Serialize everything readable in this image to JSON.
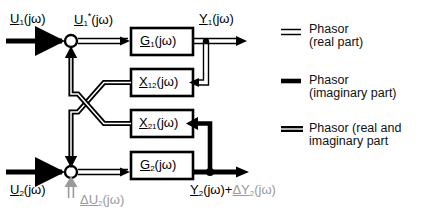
{
  "diagram": {
    "blocks": [
      {
        "id": "G1",
        "label_main": "G",
        "label_sub": "1",
        "label_tail": "(jω)"
      },
      {
        "id": "X12",
        "label_main": "X",
        "label_sub": "12",
        "label_tail": "(jω)"
      },
      {
        "id": "X21",
        "label_main": "X",
        "label_sub": "21",
        "label_tail": "(jω)"
      },
      {
        "id": "G2",
        "label_main": "G",
        "label_sub": "2",
        "label_tail": "(jω)"
      }
    ],
    "signals": {
      "u1": {
        "main": "U",
        "sub": "1",
        "sup": "",
        "tail": "(jω)"
      },
      "u1_star": {
        "main": "U",
        "sub": "1",
        "sup": "*",
        "tail": "(jω)"
      },
      "y1": {
        "main": "Y",
        "sub": "1",
        "sup": "",
        "tail": "(jω)"
      },
      "u2": {
        "main": "U",
        "sub": "2",
        "sup": "",
        "tail": "(jω)"
      },
      "delta_u2": {
        "main": "ΔU",
        "sub": "2",
        "sup": "",
        "tail": "(jω)"
      },
      "y2": {
        "main": "Y",
        "sub": "2",
        "sup": "",
        "tail": "(jω)"
      },
      "plus": {
        "text": "+"
      },
      "delta_y2": {
        "main": "ΔY",
        "sub": "2",
        "sup": "",
        "tail": "(jω)"
      }
    }
  },
  "legend": {
    "items": [
      {
        "symbol": "double-thin-line",
        "line1": "Phasor",
        "line2": "(real part)"
      },
      {
        "symbol": "thick-line",
        "line1": "Phasor",
        "line2": "(imaginary part)"
      },
      {
        "symbol": "thick-double-line",
        "line1": "Phasor (real and",
        "line2": "imaginary part"
      }
    ]
  },
  "colors": {
    "ink": "#000000",
    "grey": "#9a9a9a",
    "background": "#ffffff"
  }
}
